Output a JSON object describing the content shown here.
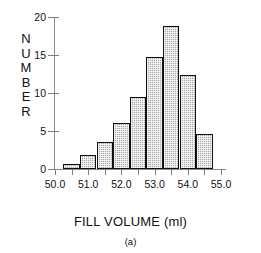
{
  "chart_data": {
    "type": "bar",
    "title": "",
    "subtitle": "",
    "xlabel": "FILL VOLUME (ml)",
    "ylabel": "NUMBER",
    "caption": "(a)",
    "grid": false,
    "legend": null,
    "bin_width": 0.5,
    "xlim": [
      50.0,
      55.0
    ],
    "ylim": [
      0,
      20
    ],
    "xticks": [
      50.0,
      50.5,
      51.0,
      51.5,
      52.0,
      52.5,
      53.0,
      53.5,
      54.0,
      54.5,
      55.0
    ],
    "xtick_labels": [
      "50.0",
      "51.0",
      "52.0",
      "53.0",
      "54.0",
      "55.0"
    ],
    "xtick_label_values": [
      50.0,
      51.0,
      52.0,
      53.0,
      54.0,
      55.0
    ],
    "yticks": [
      0,
      5,
      10,
      15,
      20
    ],
    "ytick_labels": [
      "0",
      "5",
      "10",
      "15",
      "20"
    ],
    "categories": [
      "50.25-50.75",
      "50.75-51.25",
      "51.25-51.75",
      "51.75-52.25",
      "52.25-52.75",
      "52.75-53.25",
      "53.25-53.75",
      "53.75-54.25",
      "54.25-54.75"
    ],
    "bin_edges": [
      50.25,
      50.75,
      51.25,
      51.75,
      52.25,
      52.75,
      53.25,
      53.75,
      54.25,
      54.75
    ],
    "values": [
      0.7,
      1.9,
      3.6,
      6.1,
      9.5,
      14.7,
      18.8,
      12.4,
      4.6
    ],
    "bar_fill_color": "#a9a9a9",
    "bar_edge_color": "#111111",
    "axis_color": "#8a8a8a",
    "background_color": "#ffffff"
  },
  "ylabel_letters": [
    "N",
    "U",
    "M",
    "B",
    "E",
    "R"
  ]
}
